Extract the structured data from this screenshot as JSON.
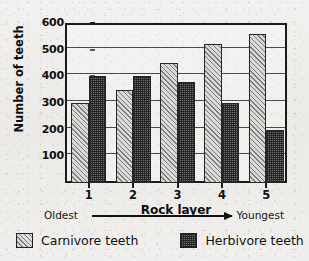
{
  "chart_data": {
    "type": "bar",
    "title": "",
    "xlabel": "Rock layer",
    "ylabel": "Number of teeth",
    "categories": [
      "1",
      "2",
      "3",
      "4",
      "5"
    ],
    "series": [
      {
        "name": "Carnivore teeth",
        "values": [
          300,
          350,
          450,
          520,
          560
        ]
      },
      {
        "name": "Herbivore teeth",
        "values": [
          400,
          400,
          380,
          300,
          200
        ]
      }
    ],
    "ylim": [
      0,
      600
    ],
    "yticks": [
      100,
      200,
      300,
      400,
      500,
      600
    ],
    "ytick_labels": [
      "100",
      "200",
      "300",
      "400",
      "500",
      "600"
    ],
    "grid": true,
    "legend_position": "bottom",
    "annotations": {
      "axis_direction_left": "Oldest",
      "axis_direction_right": "Youngest",
      "arrow": "right-arrow-icon"
    }
  },
  "legend": {
    "items": [
      {
        "label": "Carnivore teeth",
        "swatch": "carnivore-hatch-swatch"
      },
      {
        "label": "Herbivore teeth",
        "swatch": "herbivore-stipple-swatch"
      }
    ]
  }
}
